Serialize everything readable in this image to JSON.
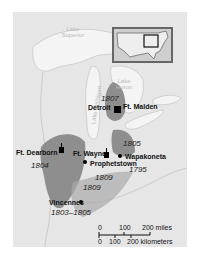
{
  "map": {
    "type": "historical-map",
    "region": "Old Northwest / Great Lakes",
    "colors": {
      "land": "#e6e6e6",
      "water": "#f2f2f2",
      "ceded": "#8e8e8e",
      "ceded_light": "#a9a9a9",
      "ink": "#111111"
    },
    "lakes": [
      {
        "name": "Lake Superior"
      },
      {
        "name": "Lake Michigan"
      },
      {
        "name": "Lake Huron"
      }
    ],
    "places": [
      {
        "name": "Ft. Dearborn",
        "kind": "fort"
      },
      {
        "name": "Detroit",
        "kind": "fort"
      },
      {
        "name": "Ft. Malden",
        "kind": "fort"
      },
      {
        "name": "Ft. Wayne",
        "kind": "fort"
      },
      {
        "name": "Prophetstown",
        "kind": "town"
      },
      {
        "name": "Wapakoneta",
        "kind": "town"
      },
      {
        "name": "Vincennes",
        "kind": "town"
      }
    ],
    "cession_years": [
      "1804",
      "1807",
      "1805",
      "1795",
      "1809",
      "1809",
      "1803–1805"
    ],
    "scale": {
      "miles": [
        "0",
        "100",
        "200 miles"
      ],
      "kilometers": [
        "0",
        "100",
        "200 kilometers"
      ]
    },
    "inset": {
      "label": "United States locator"
    }
  }
}
